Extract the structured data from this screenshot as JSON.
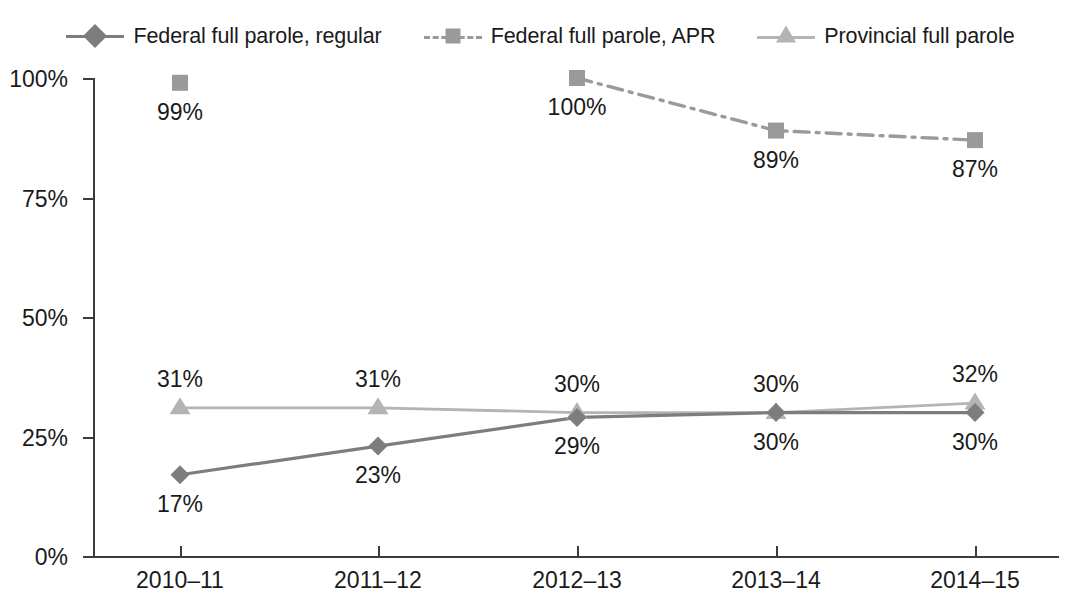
{
  "chart_data": {
    "type": "line",
    "title": "",
    "subtitle": "",
    "xlabel": "",
    "ylabel": "",
    "categories": [
      "2010–11",
      "2011–12",
      "2012–13",
      "2013–14",
      "2014–15"
    ],
    "ylim": [
      0,
      100
    ],
    "y_ticks": [
      "0%",
      "25%",
      "50%",
      "75%",
      "100%"
    ],
    "y_tick_values": [
      0,
      25,
      50,
      75,
      100
    ],
    "grid": false,
    "legend_position": "top-center",
    "series": [
      {
        "name": "Federal full parole, regular",
        "marker": "diamond",
        "line_style": "solid",
        "color": "#7d7d7d",
        "values": [
          17,
          23,
          29,
          30,
          30
        ],
        "labels": [
          "17%",
          "23%",
          "29%",
          "30%",
          "30%"
        ],
        "label_position": "below"
      },
      {
        "name": "Federal full parole, APR",
        "marker": "square",
        "line_style": "dash-dot",
        "color": "#9a9a9a",
        "values": [
          99,
          null,
          100,
          89,
          87
        ],
        "labels": [
          "99%",
          "",
          "100%",
          "89%",
          "87%"
        ],
        "label_position": "below"
      },
      {
        "name": "Provincial full parole",
        "marker": "triangle",
        "line_style": "solid",
        "color": "#b4b4b4",
        "values": [
          31,
          31,
          30,
          30,
          32
        ],
        "labels": [
          "31%",
          "31%",
          "30%",
          "30%",
          "32%"
        ],
        "label_position": "above"
      }
    ]
  },
  "legend": {
    "items": [
      {
        "label": "Federal full parole, regular",
        "marker": "diamond-marker-icon",
        "line_style": "solid"
      },
      {
        "label": "Federal full parole, APR",
        "marker": "square-marker-icon",
        "line_style": "dash-dot"
      },
      {
        "label": "Provincial full parole",
        "marker": "triangle-marker-icon",
        "line_style": "solid"
      }
    ]
  },
  "colors": {
    "federal_regular": "#7d7d7d",
    "federal_apr": "#9a9a9a",
    "provincial": "#b4b4b4",
    "axis": "#3b3b3b",
    "text": "#1a1a1a",
    "background": "#ffffff"
  },
  "axis": {
    "y_labels": [
      "100%",
      "75%",
      "50%",
      "25%",
      "0%"
    ],
    "x_labels": [
      "2010–11",
      "2011–12",
      "2012–13",
      "2013–14",
      "2014–15"
    ]
  }
}
